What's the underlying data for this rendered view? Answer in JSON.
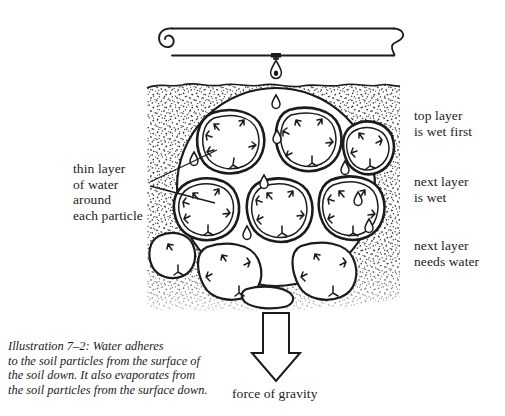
{
  "illustration": {
    "title": "Water adheres to soil particles",
    "caption": "Illustration 7–2: Water adheres\nto the soil particles from the surface of\nthe soil down. It also evaporates from\nthe soil particles from the surface down."
  },
  "labels": {
    "thin_layer": "thin layer\nof water\naround\neach particle",
    "top_layer": "top layer\nis wet first",
    "next_layer_wet": "next layer\nis wet",
    "next_layer_needs": "next layer\nneeds water",
    "force_of_gravity": "force of gravity"
  },
  "icons": {
    "pipe": "irrigation-pipe-icon",
    "emitter": "drip-emitter-icon",
    "droplet": "water-droplet-icon",
    "magnifier": "magnified-soil-circle-icon",
    "gravity_arrow": "down-arrow-icon",
    "soil": "soil-texture-icon",
    "particle": "soil-particle-icon",
    "adhesion_arrow": "adhesion-arrow-icon"
  },
  "colors": {
    "ink": "#1b1b1b",
    "paper": "#ffffff",
    "soil_stipple": "#3a3a3a"
  },
  "geometry": {
    "soil_left": 147,
    "soil_right": 400,
    "soil_top": 84,
    "soil_bottom": 311,
    "circle_cx": 276,
    "circle_cy": 187,
    "circle_r": 99,
    "pipe_left": 170,
    "pipe_right": 396,
    "pipe_top": 27,
    "pipe_bottom": 56
  }
}
